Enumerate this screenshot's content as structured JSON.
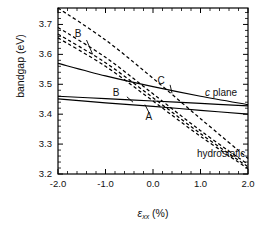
{
  "chart_data": {
    "type": "line",
    "title": "",
    "xlabel": "εxx (%)",
    "ylabel": "bandgap (eV)",
    "xlim": [
      -2.0,
      2.0
    ],
    "ylim": [
      3.2,
      3.755
    ],
    "xticks": [
      -2.0,
      -1.0,
      0.0,
      1.0,
      2.0
    ],
    "xticklabels": [
      "-2.0",
      "-1.0",
      "0.0",
      "1.0",
      "2.0"
    ],
    "yticks": [
      3.2,
      3.3,
      3.4,
      3.5,
      3.6,
      3.7
    ],
    "yticklabels": [
      "3.2",
      "3.3",
      "3.4",
      "3.5",
      "3.6",
      "3.7"
    ],
    "minor_ticks": true,
    "grid": false,
    "legend": "none",
    "series": [
      {
        "name": "c-plane-upper",
        "style": "solid",
        "group": "c plane",
        "x": [
          -2.0,
          -1.0,
          0.0,
          1.0,
          2.0
        ],
        "values": [
          3.57,
          3.528,
          3.492,
          3.46,
          3.432
        ]
      },
      {
        "name": "c-plane-B",
        "style": "solid",
        "group": "c plane",
        "label": "B",
        "x": [
          -2.0,
          -1.0,
          0.0,
          1.0,
          2.0
        ],
        "values": [
          3.46,
          3.452,
          3.444,
          3.436,
          3.428
        ]
      },
      {
        "name": "c-plane-A",
        "style": "solid",
        "group": "c plane",
        "label": "A",
        "x": [
          -2.0,
          -1.0,
          0.0,
          1.0,
          2.0
        ],
        "values": [
          3.451,
          3.438,
          3.426,
          3.413,
          3.4
        ]
      },
      {
        "name": "hydrostatic-C",
        "style": "dashed",
        "group": "hydrostatic",
        "label": "C",
        "x": [
          -2.0,
          -1.0,
          0.0,
          1.0,
          2.0
        ],
        "values": [
          3.755,
          3.648,
          3.52,
          3.385,
          3.252
        ]
      },
      {
        "name": "hydrostatic-B",
        "style": "dashed",
        "group": "hydrostatic",
        "label": "B",
        "x": [
          -2.0,
          -1.0,
          0.0,
          1.0,
          2.0
        ],
        "values": [
          3.69,
          3.59,
          3.468,
          3.345,
          3.232
        ]
      },
      {
        "name": "hydrostatic-B2",
        "style": "dashed",
        "group": "hydrostatic",
        "x": [
          -2.0,
          -1.0,
          0.0,
          1.0,
          2.0
        ],
        "values": [
          3.668,
          3.572,
          3.455,
          3.335,
          3.224
        ]
      },
      {
        "name": "hydrostatic-A",
        "style": "dashed",
        "group": "hydrostatic",
        "x": [
          -2.0,
          -1.0,
          0.0,
          1.0,
          2.0
        ],
        "values": [
          3.655,
          3.56,
          3.444,
          3.326,
          3.218
        ]
      }
    ],
    "annotations": [
      {
        "name": "label-B-upper",
        "text": "B",
        "x": -1.52,
        "y": 3.665
      },
      {
        "name": "label-C",
        "text": "C",
        "x": 0.22,
        "y": 3.508
      },
      {
        "name": "label-B-lower",
        "text": "B",
        "x": -0.72,
        "y": 3.468
      },
      {
        "name": "label-A",
        "text": "A",
        "x": -0.03,
        "y": 3.388
      },
      {
        "name": "label-c-plane",
        "text": "c plane",
        "x": 1.22,
        "y": 3.466
      },
      {
        "name": "label-hydrostatic",
        "text": "hydrostatic",
        "x": 1.05,
        "y": 3.262
      }
    ]
  },
  "axes": {
    "ylabel": "bandgap (eV)",
    "xlabel_symbol": "ε",
    "xlabel_sub": "xx",
    "xlabel_unit": "(%)",
    "yticklabels": [
      "3.7",
      "3.6",
      "3.5",
      "3.4",
      "3.3",
      "3.2"
    ],
    "xticklabels": [
      "-2.0",
      "-1.0",
      "0.0",
      "1.0",
      "2.0"
    ]
  },
  "labels": {
    "b_upper": "B",
    "b_lower": "B",
    "c": "C",
    "a": "A",
    "c_plane_italic": "c",
    "c_plane_rest": " plane",
    "hydrostatic": "hydrostatic"
  },
  "colors": {
    "line": "#000000",
    "background": "#ffffff",
    "text": "#111111"
  }
}
